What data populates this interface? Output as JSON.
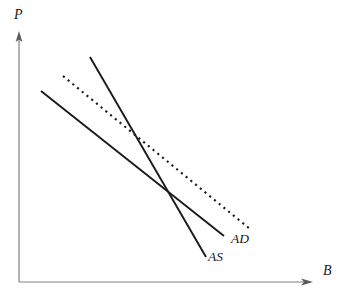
{
  "figure": {
    "type": "economics-diagram",
    "background_color": "#ffffff",
    "width": 342,
    "height": 303
  },
  "axes": {
    "origin": [
      19,
      282
    ],
    "y_axis": {
      "label": "P",
      "from": [
        19,
        282
      ],
      "to": [
        19,
        33
      ],
      "color": "#808080",
      "arrow": true
    },
    "x_axis": {
      "label": "B",
      "from": [
        19,
        282
      ],
      "to": [
        312,
        282
      ],
      "color": "#808080",
      "arrow": true
    }
  },
  "curves": [
    {
      "name": "AD",
      "label": "AD",
      "style": "solid",
      "color": "#1a1a1a",
      "from": [
        41,
        91
      ],
      "to": [
        224,
        236
      ],
      "label_position": [
        231,
        232
      ]
    },
    {
      "name": "AS",
      "label": "AS",
      "style": "solid",
      "color": "#1a1a1a",
      "from": [
        90,
        57
      ],
      "to": [
        206,
        257
      ],
      "label_position": [
        208,
        250
      ]
    },
    {
      "name": "AD-shifted",
      "label": "",
      "style": "dotted",
      "color": "#1a1a1a",
      "from": [
        63,
        76
      ],
      "to": [
        250,
        229
      ],
      "label_position": null
    }
  ],
  "intersections": [
    {
      "name": "equilibrium-original",
      "curves": [
        "AD",
        "AS"
      ],
      "point": [
        169,
        193
      ]
    },
    {
      "name": "equilibrium-shifted",
      "curves": [
        "AD-shifted",
        "AS"
      ],
      "point": [
        134,
        134
      ]
    }
  ],
  "chart_data": {
    "type": "line",
    "title": "",
    "xlabel": "B",
    "ylabel": "P",
    "grid": false,
    "legend": "inline-curve-labels",
    "xlim": [
      19,
      312
    ],
    "ylim": [
      282,
      33
    ],
    "series": [
      {
        "name": "AD",
        "style": "solid",
        "points": [
          [
            41,
            91
          ],
          [
            224,
            236
          ]
        ]
      },
      {
        "name": "AS",
        "style": "solid",
        "points": [
          [
            90,
            57
          ],
          [
            206,
            257
          ]
        ]
      },
      {
        "name": "AD-shifted",
        "style": "dotted",
        "points": [
          [
            63,
            76
          ],
          [
            250,
            229
          ]
        ]
      }
    ],
    "annotations": [
      {
        "text": "AD",
        "at": [
          231,
          232
        ]
      },
      {
        "text": "AS",
        "at": [
          208,
          250
        ]
      },
      {
        "text": "P",
        "at": [
          14,
          8
        ]
      },
      {
        "text": "B",
        "at": [
          323,
          264
        ]
      }
    ]
  }
}
